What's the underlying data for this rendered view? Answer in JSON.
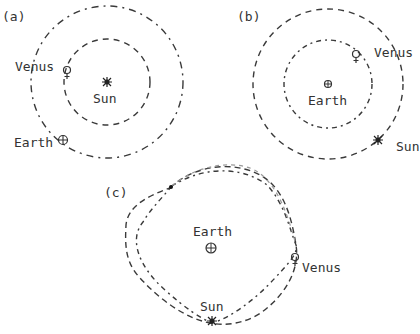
{
  "panels": {
    "a": {
      "label": "(a)",
      "center_body": "Sun",
      "inner_body": "Venus",
      "outer_body": "Earth",
      "symbols": {
        "sun": "sun-star",
        "venus": "♀",
        "earth": "⊕"
      }
    },
    "b": {
      "label": "(b)",
      "center_body": "Earth",
      "inner_body": "Venus",
      "outer_body": "Sun",
      "symbols": {
        "sun": "sun-star",
        "venus": "♀",
        "earth": "⊕"
      }
    },
    "c": {
      "label": "(c)",
      "center_body": "Earth",
      "body_1": "Venus",
      "body_2": "Sun",
      "symbols": {
        "sun": "sun-star",
        "venus": "♀",
        "earth": "⊕"
      }
    }
  },
  "style": {
    "line_color": "#3a3a3a",
    "light_line_color": "#9a9a9a",
    "background": "#ffffff"
  }
}
